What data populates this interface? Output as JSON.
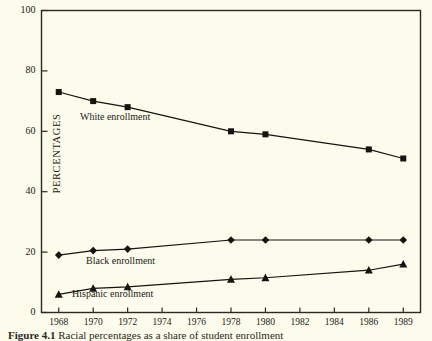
{
  "chart_data": {
    "type": "line",
    "title": "",
    "xlabel": "",
    "ylabel": "PERCENTAGES",
    "ylim": [
      0,
      100
    ],
    "yticks": [
      0,
      20,
      40,
      60,
      80,
      100
    ],
    "xticks": [
      "1968",
      "1970",
      "1972",
      "1974",
      "1976",
      "1978",
      "1980",
      "1982",
      "1984",
      "1986",
      "1989"
    ],
    "grid": false,
    "legend_position": "inline-annotations",
    "x": [
      1968,
      1970,
      1972,
      1978,
      1980,
      1986,
      1989
    ],
    "series": [
      {
        "name": "White enrollment",
        "marker": "square",
        "color": "#141410",
        "values": [
          73,
          70,
          68,
          60,
          59,
          54,
          51
        ]
      },
      {
        "name": "Black enrollment",
        "marker": "diamond",
        "color": "#141410",
        "values": [
          19,
          20.5,
          21,
          24,
          24,
          24,
          24
        ]
      },
      {
        "name": "Hispanic enrollment",
        "marker": "triangle",
        "color": "#141410",
        "values": [
          6,
          8,
          8.5,
          11,
          11.5,
          14,
          16
        ]
      }
    ],
    "annotations": [
      {
        "text": "White enrollment",
        "x_px": 80,
        "y_px": 111
      },
      {
        "text": "Black enrollment",
        "x_px": 86,
        "y_px": 255
      },
      {
        "text": "Hispanic enrollment",
        "x_px": 72,
        "y_px": 288
      }
    ]
  },
  "figure": {
    "caption_label": "Figure 4.1",
    "caption_text": "Racial percentages as a share of student enrollment"
  }
}
